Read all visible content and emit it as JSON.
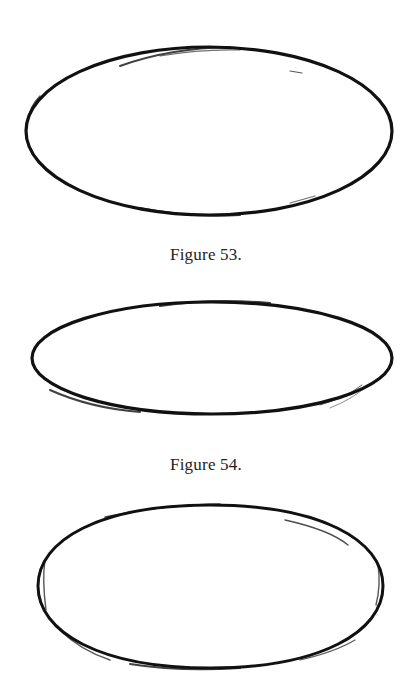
{
  "figures": [
    {
      "id": "fig-53",
      "caption": "Figure 53.",
      "shape": "ellipse",
      "center": [
        209,
        131
      ],
      "rx": 183,
      "ry": 84,
      "stroke": "#111111"
    },
    {
      "id": "fig-54",
      "caption": "Figure 54.",
      "shape": "ellipse",
      "center": [
        212,
        358
      ],
      "rx": 180,
      "ry": 56,
      "stroke": "#111111"
    },
    {
      "id": "fig-55",
      "caption": "",
      "shape": "rounded-ellipse",
      "center": [
        210,
        586
      ],
      "rx": 172,
      "ry": 81,
      "stroke": "#111111"
    }
  ]
}
